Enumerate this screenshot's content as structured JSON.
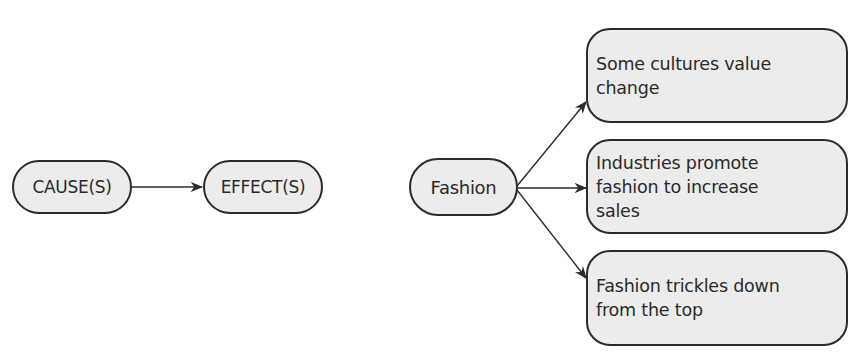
{
  "legend_diagram": {
    "cause_label": "CAUSE(S)",
    "effect_label": "EFFECT(S)"
  },
  "example_diagram": {
    "cause_label": "Fashion",
    "effects": [
      {
        "label": "Some cultures value change"
      },
      {
        "label": "Industries promote fashion to increase sales"
      },
      {
        "label": "Fashion trickles down from the top"
      }
    ]
  },
  "colors": {
    "node_fill": "#ececec",
    "node_border": "#2b2b2b",
    "arrow": "#2b2b2b",
    "background": "#ffffff"
  }
}
